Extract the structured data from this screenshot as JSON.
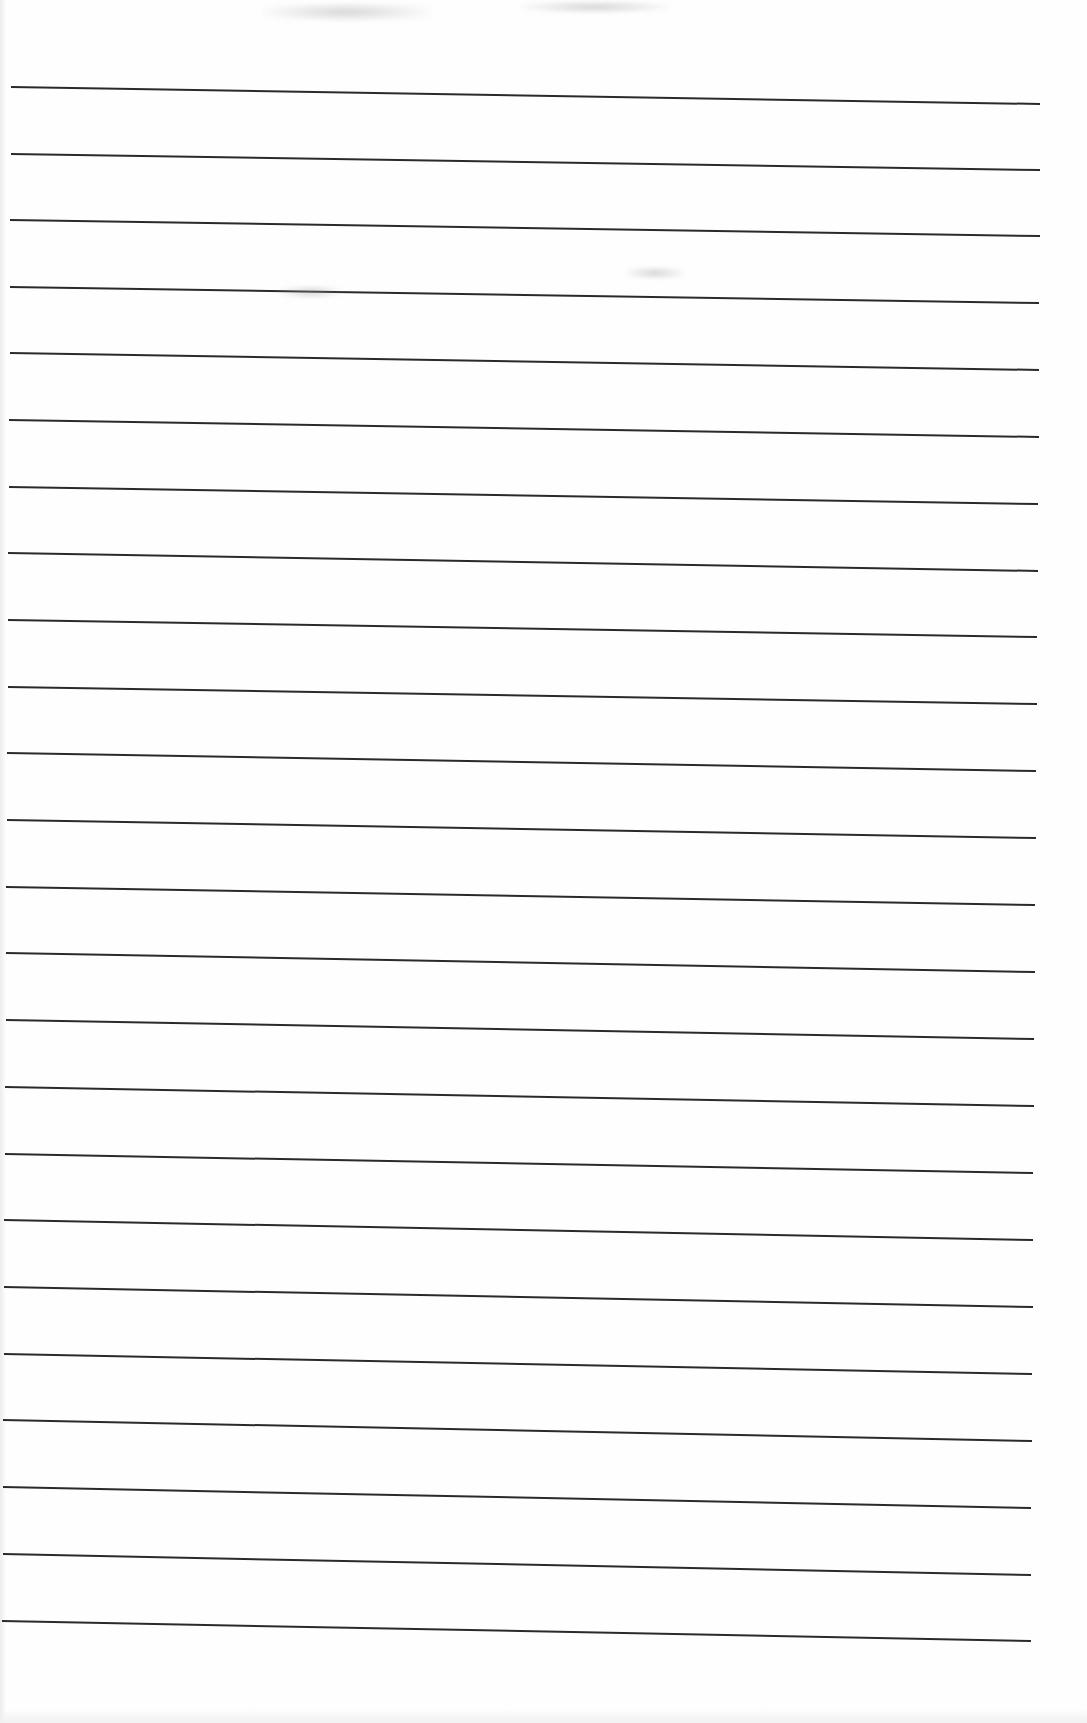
{
  "document": {
    "type": "ruled-paper",
    "text_content": "",
    "line_count": 24,
    "line_color": "#2a2a2a",
    "background_color": "#fefefe",
    "lines": [
      {
        "x1": 11,
        "y1": 87,
        "x2": 1040,
        "y2": 104
      },
      {
        "x1": 11,
        "y1": 154,
        "x2": 1040,
        "y2": 170
      },
      {
        "x1": 10,
        "y1": 220,
        "x2": 1040,
        "y2": 236
      },
      {
        "x1": 10,
        "y1": 287,
        "x2": 1039,
        "y2": 303
      },
      {
        "x1": 10,
        "y1": 353,
        "x2": 1039,
        "y2": 370
      },
      {
        "x1": 9,
        "y1": 420,
        "x2": 1039,
        "y2": 437
      },
      {
        "x1": 9,
        "y1": 487,
        "x2": 1038,
        "y2": 504
      },
      {
        "x1": 8,
        "y1": 553,
        "x2": 1038,
        "y2": 571
      },
      {
        "x1": 8,
        "y1": 620,
        "x2": 1037,
        "y2": 637
      },
      {
        "x1": 8,
        "y1": 687,
        "x2": 1037,
        "y2": 704
      },
      {
        "x1": 7,
        "y1": 753,
        "x2": 1036,
        "y2": 771
      },
      {
        "x1": 7,
        "y1": 820,
        "x2": 1036,
        "y2": 838
      },
      {
        "x1": 6,
        "y1": 887,
        "x2": 1035,
        "y2": 905
      },
      {
        "x1": 6,
        "y1": 953,
        "x2": 1035,
        "y2": 972
      },
      {
        "x1": 6,
        "y1": 1020,
        "x2": 1034,
        "y2": 1039
      },
      {
        "x1": 5,
        "y1": 1087,
        "x2": 1034,
        "y2": 1106
      },
      {
        "x1": 5,
        "y1": 1154,
        "x2": 1033,
        "y2": 1173
      },
      {
        "x1": 4,
        "y1": 1220,
        "x2": 1033,
        "y2": 1240
      },
      {
        "x1": 4,
        "y1": 1287,
        "x2": 1033,
        "y2": 1307
      },
      {
        "x1": 4,
        "y1": 1354,
        "x2": 1032,
        "y2": 1374
      },
      {
        "x1": 3,
        "y1": 1420,
        "x2": 1032,
        "y2": 1441
      },
      {
        "x1": 3,
        "y1": 1487,
        "x2": 1031,
        "y2": 1508
      },
      {
        "x1": 3,
        "y1": 1554,
        "x2": 1031,
        "y2": 1575
      },
      {
        "x1": 2,
        "y1": 1621,
        "x2": 1031,
        "y2": 1641
      }
    ],
    "smudges": [
      {
        "x": 262,
        "y": 2,
        "w": 170,
        "h": 20
      },
      {
        "x": 520,
        "y": 0,
        "w": 150,
        "h": 14
      },
      {
        "x": 278,
        "y": 285,
        "w": 65,
        "h": 14
      },
      {
        "x": 625,
        "y": 266,
        "w": 60,
        "h": 14
      }
    ]
  }
}
